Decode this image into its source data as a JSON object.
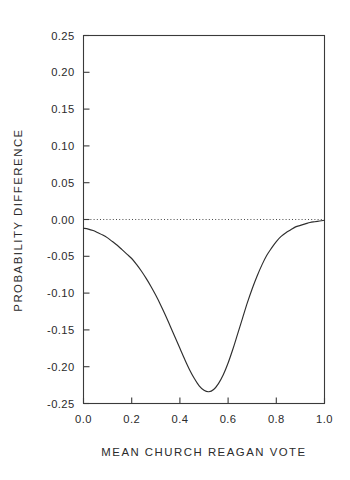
{
  "chart_data": {
    "type": "line",
    "title": "",
    "subtitle": "",
    "xlabel": "MEAN CHURCH REAGAN VOTE",
    "ylabel": "PROBABILITY DIFFERENCE",
    "xlim": [
      0.0,
      1.0
    ],
    "ylim": [
      -0.25,
      0.25
    ],
    "grid": false,
    "legend": null,
    "xticks": [
      0.0,
      0.2,
      0.4,
      0.6,
      0.8,
      1.0
    ],
    "xticklabels": [
      "0.0",
      "0.2",
      "0.4",
      "0.6",
      "0.8",
      "1.0"
    ],
    "yticks": [
      -0.25,
      -0.2,
      -0.15,
      -0.1,
      -0.05,
      0.0,
      0.05,
      0.1,
      0.15,
      0.2,
      0.25
    ],
    "yticklabels": [
      "-0.25",
      "-0.20",
      "-0.15",
      "-0.10",
      "-0.05",
      "0.00",
      "0.05",
      "0.10",
      "0.15",
      "0.20",
      "0.25"
    ],
    "annotations": [
      {
        "name": "zero-reference-line",
        "y": 0.0,
        "style": "dotted",
        "label": ""
      }
    ],
    "series": [
      {
        "name": "probability difference",
        "style": "solid",
        "color": "#2e2e2e",
        "x": [
          0.0,
          0.02,
          0.04,
          0.06,
          0.08,
          0.1,
          0.12,
          0.14,
          0.16,
          0.18,
          0.2,
          0.22,
          0.24,
          0.26,
          0.28,
          0.3,
          0.32,
          0.34,
          0.36,
          0.38,
          0.4,
          0.42,
          0.44,
          0.46,
          0.48,
          0.5,
          0.52,
          0.54,
          0.56,
          0.58,
          0.6,
          0.62,
          0.64,
          0.66,
          0.68,
          0.7,
          0.72,
          0.74,
          0.76,
          0.78,
          0.8,
          0.82,
          0.84,
          0.86,
          0.88,
          0.9,
          0.92,
          0.94,
          0.96,
          0.98,
          1.0
        ],
        "y": [
          -0.012,
          -0.013,
          -0.015,
          -0.018,
          -0.021,
          -0.025,
          -0.03,
          -0.035,
          -0.041,
          -0.047,
          -0.053,
          -0.061,
          -0.07,
          -0.08,
          -0.091,
          -0.103,
          -0.116,
          -0.13,
          -0.145,
          -0.16,
          -0.175,
          -0.19,
          -0.204,
          -0.216,
          -0.226,
          -0.232,
          -0.234,
          -0.231,
          -0.223,
          -0.211,
          -0.195,
          -0.176,
          -0.155,
          -0.134,
          -0.113,
          -0.094,
          -0.077,
          -0.062,
          -0.049,
          -0.039,
          -0.03,
          -0.023,
          -0.018,
          -0.014,
          -0.01,
          -0.008,
          -0.006,
          -0.004,
          -0.003,
          -0.002,
          -0.001
        ]
      }
    ],
    "key_points": {
      "minimum_x": 0.52,
      "minimum_y": -0.234,
      "left_endpoint_y": -0.012,
      "right_endpoint_y": -0.001
    }
  },
  "colors": {
    "background": "#ffffff",
    "axis": "#3a3a3a",
    "curve": "#2e2e2e",
    "zeroline": "#4a4a4a",
    "text": "#2b2b2b"
  }
}
